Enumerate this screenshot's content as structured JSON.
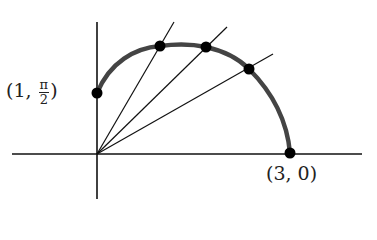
{
  "diagram": {
    "type": "polar-curve-with-rays",
    "colors": {
      "axis": "#111111",
      "curve": "#444444",
      "point": "#000000",
      "text": "#222222"
    },
    "origin_px": [
      97,
      154
    ],
    "axes": {
      "x_left": 12,
      "x_right": 362,
      "y_top": 22,
      "y_bottom": 199
    },
    "curve_points_px": [
      [
        97,
        93
      ],
      [
        160,
        46
      ],
      [
        206,
        47
      ],
      [
        249,
        69
      ],
      [
        290,
        153
      ]
    ],
    "rays_end_px": [
      [
        174,
        22
      ],
      [
        227,
        27
      ],
      [
        273,
        54
      ]
    ],
    "labels": {
      "start_point": {
        "open": "(1,",
        "num": "π",
        "den": "2",
        "close": ")"
      },
      "end_point": "(3, 0)"
    }
  }
}
